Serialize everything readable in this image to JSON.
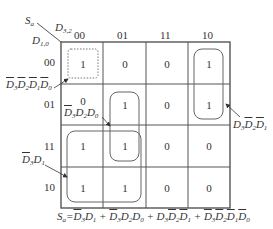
{
  "kmap": {
    "output_var": "S",
    "output_sub": "a",
    "col_var": "D",
    "col_sub": "3,2",
    "row_var": "D",
    "row_sub": "1,0",
    "col_headers": [
      "00",
      "01",
      "11",
      "10"
    ],
    "row_headers": [
      "00",
      "01",
      "11",
      "10"
    ],
    "cells": [
      [
        "1",
        "0",
        "0",
        "1"
      ],
      [
        "0",
        "1",
        "0",
        "1"
      ],
      [
        "1",
        "1",
        "0",
        "0"
      ],
      [
        "1",
        "1",
        "0",
        "0"
      ]
    ]
  },
  "groups": [
    {
      "term": "D̄3D̄2D̄1D̄0",
      "label_parts": [
        [
          "D",
          "3",
          true
        ],
        [
          "D",
          "2",
          true
        ],
        [
          "D",
          "1",
          true
        ],
        [
          "D",
          "0",
          true
        ]
      ],
      "style": "dotted",
      "cells": "r00c00"
    },
    {
      "term": "D̄3D2D0",
      "label_parts": [
        [
          "D",
          "3",
          true
        ],
        [
          "D",
          "2",
          false
        ],
        [
          "D",
          "0",
          false
        ]
      ],
      "style": "solid",
      "cells": "r01-r11 c01"
    },
    {
      "term": "D3D̄2D̄1",
      "label_parts": [
        [
          "D",
          "3",
          false
        ],
        [
          "D",
          "2",
          true
        ],
        [
          "D",
          "1",
          true
        ]
      ],
      "style": "solid",
      "cells": "r00-r01 c10"
    },
    {
      "term": "D̄3D1",
      "label_parts": [
        [
          "D",
          "3",
          true
        ],
        [
          "D",
          "1",
          false
        ]
      ],
      "style": "solid",
      "cells": "r11-r10 c00-c01"
    }
  ],
  "equation": {
    "lhs": "Sa",
    "text": "Sa = D̄3D1 + D̄3D2D0 + D3D̄2D̄1 + D̄3D̄2D̄1D̄0"
  },
  "colors": {
    "line": "#555555",
    "text": "#333333"
  }
}
